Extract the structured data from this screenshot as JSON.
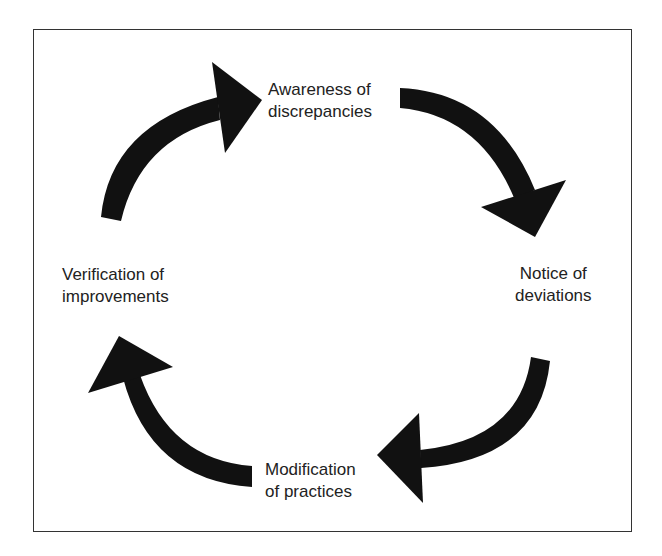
{
  "diagram": {
    "type": "cycle",
    "direction": "clockwise",
    "stages": [
      {
        "id": "top",
        "line1": "Awareness of",
        "line2": "discrepancies"
      },
      {
        "id": "right",
        "line1": "Notice of",
        "line2": "deviations"
      },
      {
        "id": "bottom",
        "line1": "Modification",
        "line2": "of practices"
      },
      {
        "id": "left",
        "line1": "Verification of",
        "line2": "improvements"
      }
    ],
    "arrow_color": "#111111",
    "frame_color": "#333333"
  }
}
